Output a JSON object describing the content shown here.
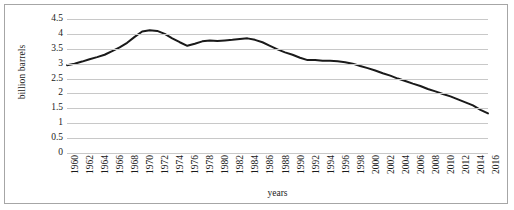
{
  "chart_data": {
    "type": "line",
    "title": "",
    "xlabel": "years",
    "ylabel": "billion barrels",
    "ylim": [
      0,
      4.5
    ],
    "yticks": [
      0,
      0.5,
      1,
      1.5,
      2,
      2.5,
      3,
      3.5,
      4,
      4.5
    ],
    "ytick_labels": [
      "0",
      "0.5",
      "1",
      "1.5",
      "2",
      "2.5",
      "3",
      "3.5",
      "4",
      "4.5"
    ],
    "xlim": [
      1960,
      2016
    ],
    "xtick_labels": [
      "1960",
      "1962",
      "1964",
      "1966",
      "1968",
      "1970",
      "1972",
      "1974",
      "1976",
      "1978",
      "1980",
      "1982",
      "1984",
      "1986",
      "1988",
      "1990",
      "1992",
      "1994",
      "1996",
      "1998",
      "2000",
      "2002",
      "2004",
      "2006",
      "2008",
      "2010",
      "2012",
      "2014",
      "2016"
    ],
    "grid": true,
    "legend": false,
    "line_color": "#1a1a1a",
    "gridline_color": "#c8c8c8",
    "border_color": "#a6a6a6",
    "series": [
      {
        "name": "oil discoveries",
        "x": [
          1960,
          1961,
          1962,
          1963,
          1964,
          1965,
          1966,
          1967,
          1968,
          1969,
          1970,
          1971,
          1972,
          1973,
          1974,
          1975,
          1976,
          1977,
          1978,
          1979,
          1980,
          1981,
          1982,
          1983,
          1984,
          1985,
          1986,
          1987,
          1988,
          1989,
          1990,
          1991,
          1992,
          1993,
          1994,
          1995,
          1996,
          1997,
          1998,
          1999,
          2000,
          2001,
          2002,
          2003,
          2004,
          2005,
          2006,
          2007,
          2008,
          2009,
          2010,
          2011,
          2012,
          2013,
          2014,
          2015,
          2016
        ],
        "values": [
          2.95,
          3.0,
          3.07,
          3.15,
          3.22,
          3.3,
          3.42,
          3.55,
          3.7,
          3.9,
          4.08,
          4.12,
          4.1,
          4.0,
          3.85,
          3.72,
          3.6,
          3.67,
          3.75,
          3.78,
          3.76,
          3.78,
          3.8,
          3.83,
          3.85,
          3.8,
          3.72,
          3.6,
          3.48,
          3.38,
          3.3,
          3.2,
          3.12,
          3.12,
          3.1,
          3.1,
          3.08,
          3.05,
          3.0,
          2.92,
          2.85,
          2.77,
          2.68,
          2.6,
          2.5,
          2.42,
          2.33,
          2.25,
          2.15,
          2.07,
          1.98,
          1.9,
          1.8,
          1.7,
          1.6,
          1.45,
          1.33
        ]
      }
    ]
  }
}
